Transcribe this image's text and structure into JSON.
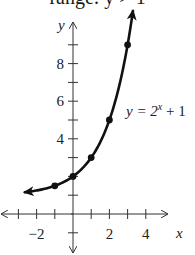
{
  "caption": "range: y > 1",
  "chart_data": {
    "type": "line",
    "title": "",
    "function_label": "y = 2^x + 1",
    "function_label_parts": {
      "lhs": "y = 2",
      "exp": "x",
      "rhs": " + 1"
    },
    "xlabel": "x",
    "ylabel": "y",
    "x_tick_labels": [
      "−2",
      "2",
      "4"
    ],
    "y_tick_labels": [
      "4",
      "6",
      "8"
    ],
    "x_ticks": [
      -3,
      -2,
      -1,
      0,
      1,
      2,
      3,
      4
    ],
    "y_ticks": [
      -1,
      1,
      2,
      3,
      4,
      5,
      6,
      7,
      8,
      9
    ],
    "xlim": [
      -4,
      5
    ],
    "ylim": [
      -2,
      10
    ],
    "grid": false,
    "points": [
      {
        "x": -1,
        "y": 1.5
      },
      {
        "x": 0,
        "y": 2
      },
      {
        "x": 1,
        "y": 3
      },
      {
        "x": 2,
        "y": 5
      },
      {
        "x": 3,
        "y": 9
      }
    ],
    "curve_x_range": [
      -2.7,
      3.3
    ],
    "asymptote": "y = 1",
    "colors": {
      "curve": "#111111",
      "axes": "#333333"
    }
  }
}
